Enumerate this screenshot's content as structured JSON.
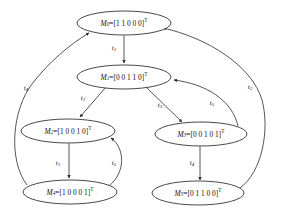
{
  "diagram": {
    "type": "state-transition-graph",
    "colors": {
      "background": "#ffffff",
      "node_stroke": "#1a1a1a",
      "node_fill": "#ffffff",
      "edge_stroke": "#2b2b2b",
      "text": "#111111"
    }
  },
  "nodes": [
    {
      "id": "M0",
      "name": "M",
      "subscript": "0",
      "equals": "=[",
      "vector": "1 1 0 0 0",
      "close": "]",
      "superscript": "T",
      "full_text": "M0=[1 1 0 0 0]T",
      "cx": 124,
      "cy": 23,
      "rx": 47,
      "ry": 12
    },
    {
      "id": "M1",
      "name": "M",
      "subscript": "1",
      "equals": "=[",
      "vector": "0 0 1 1 0",
      "close": "]",
      "superscript": "T",
      "full_text": "M1=[0 0 1 1 0]T",
      "cx": 124,
      "cy": 77,
      "rx": 47,
      "ry": 12
    },
    {
      "id": "M2",
      "name": "M",
      "subscript": "2",
      "equals": "=[",
      "vector": "1 0 0 1 0",
      "close": "]",
      "superscript": "T",
      "full_text": "M2=[1 0 0 1 0]T",
      "cx": 68,
      "cy": 131,
      "rx": 47,
      "ry": 12
    },
    {
      "id": "M3",
      "name": "M",
      "subscript": "3",
      "equals": "=[",
      "vector": "0 0 1 0 1",
      "close": "]",
      "superscript": "T",
      "full_text": "M3=[0 0 1 0 1]T",
      "cx": 201,
      "cy": 134,
      "rx": 46,
      "ry": 12
    },
    {
      "id": "M4",
      "name": "M",
      "subscript": "4",
      "equals": "=[",
      "vector": "1 0 0 0 1",
      "close": "]",
      "superscript": "T",
      "full_text": "M4=[1 0 0 0 1]T",
      "cx": 70,
      "cy": 192,
      "rx": 47,
      "ry": 12
    },
    {
      "id": "M5",
      "name": "M",
      "subscript": "5",
      "equals": "=[",
      "vector": "0 1 1 0 0",
      "close": "]",
      "superscript": "T",
      "full_text": "M5=[0 1 1 0 0]T",
      "cx": 198,
      "cy": 193,
      "rx": 46,
      "ry": 12
    }
  ],
  "edges": [
    {
      "id": "e-t1",
      "from": "M0",
      "to": "M1",
      "name": "t",
      "subscript": "1",
      "full_text": "t1",
      "label_x": 114,
      "label_y": 48,
      "shape": "straight"
    },
    {
      "id": "e-t2-left",
      "from": "M1",
      "to": "M2",
      "name": "t",
      "subscript": "2",
      "full_text": "t2",
      "label_x": 83,
      "label_y": 98,
      "shape": "straight"
    },
    {
      "id": "e-t3-left",
      "from": "M2",
      "to": "M4",
      "name": "t",
      "subscript": "3",
      "full_text": "t3",
      "label_x": 58,
      "label_y": 163,
      "shape": "straight"
    },
    {
      "id": "e-t5-left",
      "from": "M4",
      "to": "M2",
      "name": "t",
      "subscript": "5",
      "full_text": "t5",
      "label_x": 114,
      "label_y": 163,
      "shape": "curve"
    },
    {
      "id": "e-t4-left",
      "from": "M4",
      "to": "M0",
      "name": "t",
      "subscript": "4",
      "full_text": "t4",
      "label_x": 26,
      "label_y": 88,
      "shape": "curve"
    },
    {
      "id": "e-t3-right",
      "from": "M1",
      "to": "M3",
      "name": "t",
      "subscript": "3",
      "full_text": "t3",
      "label_x": 160,
      "label_y": 105,
      "shape": "straight"
    },
    {
      "id": "e-t4-right",
      "from": "M3",
      "to": "M5",
      "name": "t",
      "subscript": "4",
      "full_text": "t4",
      "label_x": 192,
      "label_y": 163,
      "shape": "straight"
    },
    {
      "id": "e-t5-right",
      "from": "M3",
      "to": "M1",
      "name": "t",
      "subscript": "5",
      "full_text": "t5",
      "label_x": 212,
      "label_y": 103,
      "shape": "curve"
    },
    {
      "id": "e-t2-right",
      "from": "M5",
      "to": "M0",
      "name": "t",
      "subscript": "2",
      "full_text": "t2",
      "label_x": 250,
      "label_y": 87,
      "shape": "curve"
    }
  ]
}
